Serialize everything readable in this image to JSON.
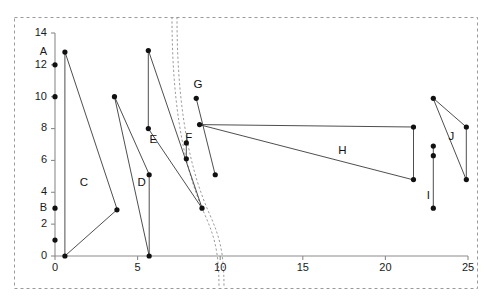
{
  "figure": {
    "title": "",
    "background_color": "#ffffff",
    "axis_color": "#8c8c8c",
    "series_color": "#3a3a3a",
    "marker_color": "#111111",
    "boundary_color": "#9a9a9a"
  },
  "chart_data": {
    "type": "scatter",
    "title": "",
    "xlabel": "",
    "ylabel": "",
    "xlim": [
      0,
      25
    ],
    "ylim": [
      0,
      14
    ],
    "grid": false,
    "legend": "none",
    "x_ticks": [
      0,
      5,
      10,
      15,
      20,
      25
    ],
    "x_tick_labels": [
      "0",
      "5",
      "10",
      "15",
      "20",
      "25"
    ],
    "y_ticks": [
      0,
      2,
      4,
      6,
      8,
      10,
      12,
      14
    ],
    "y_tick_labels": [
      "0",
      "2",
      "4",
      "6",
      "8",
      "10",
      "12",
      "14"
    ],
    "axis_point_labels": [
      {
        "label": "A",
        "x": 0,
        "y": 12.8
      },
      {
        "label": "B",
        "x": 0,
        "y": 3.0
      }
    ],
    "axis_points": [
      {
        "x": 0,
        "y": 12.0
      },
      {
        "x": 0,
        "y": 10.0
      },
      {
        "x": 0,
        "y": 3.0
      },
      {
        "x": 0,
        "y": 1.0
      }
    ],
    "shapes": [
      {
        "label": "C",
        "label_pos": {
          "x": 1.75,
          "y": 4.6
        },
        "type": "polygon",
        "points": [
          [
            0.6,
            12.8
          ],
          [
            0.6,
            0.0
          ],
          [
            3.75,
            2.9
          ]
        ]
      },
      {
        "label": "D",
        "label_pos": {
          "x": 5.25,
          "y": 4.6
        },
        "type": "polygon",
        "points": [
          [
            3.6,
            10.0
          ],
          [
            5.7,
            0.0
          ],
          [
            5.7,
            5.1
          ]
        ]
      },
      {
        "label": "E",
        "label_pos": {
          "x": 5.95,
          "y": 7.3
        },
        "type": "polygon",
        "points": [
          [
            5.65,
            12.9
          ],
          [
            5.65,
            8.0
          ],
          [
            8.9,
            3.0
          ]
        ]
      },
      {
        "label": "F",
        "label_pos": {
          "x": 8.1,
          "y": 7.4
        },
        "type": "segment",
        "points": [
          [
            7.95,
            7.1
          ],
          [
            7.95,
            6.1
          ]
        ]
      },
      {
        "label": "G",
        "label_pos": {
          "x": 8.65,
          "y": 10.75
        },
        "type": "segment",
        "points": [
          [
            8.55,
            9.9
          ],
          [
            9.7,
            5.1
          ]
        ]
      },
      {
        "label": "H",
        "label_pos": {
          "x": 17.4,
          "y": 6.6
        },
        "type": "polygon",
        "points": [
          [
            8.75,
            8.25
          ],
          [
            21.7,
            8.1
          ],
          [
            21.7,
            4.8
          ]
        ]
      },
      {
        "label": "I",
        "label_pos": {
          "x": 22.6,
          "y": 3.8
        },
        "type": "segment",
        "points": [
          [
            22.9,
            6.9
          ],
          [
            22.9,
            3.0
          ]
        ]
      },
      {
        "label": "J",
        "label_pos": {
          "x": 24.0,
          "y": 7.5
        },
        "type": "polygon",
        "points": [
          [
            22.9,
            9.9
          ],
          [
            24.9,
            8.1
          ],
          [
            24.9,
            4.8
          ]
        ]
      }
    ],
    "extra_points": [
      {
        "x": 22.9,
        "y": 6.3
      }
    ],
    "region_boundaries": [
      {
        "name": "outer-dashed-frame",
        "style": "dashed-rectangle"
      },
      {
        "name": "left-region-divider",
        "style": "dashed-curve-pair"
      }
    ]
  }
}
